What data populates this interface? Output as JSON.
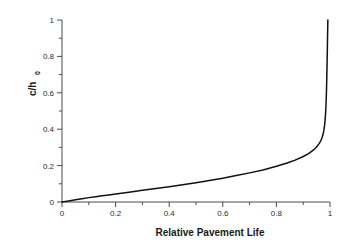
{
  "chart_data": {
    "type": "line",
    "title": "",
    "xlabel": "Relative Pavement Life",
    "ylabel": "c/h",
    "ylabel_subscript": "0",
    "ylabel_full": "c/h0",
    "xlim": [
      0,
      1
    ],
    "ylim": [
      0,
      1
    ],
    "xticks": [
      "0",
      "0.2",
      "0.4",
      "0.6",
      "0.8",
      "1"
    ],
    "xtick_values": [
      0,
      0.2,
      0.4,
      0.6,
      0.8,
      1
    ],
    "yticks": [
      "0",
      "0.2",
      "0.4",
      "0.6",
      "0.8",
      "1"
    ],
    "ytick_values": [
      0,
      0.2,
      0.4,
      0.6,
      0.8,
      1
    ],
    "grid": false,
    "legend": false,
    "legend_position": "none",
    "minor_ticks": true,
    "series": [
      {
        "name": "crack depth ratio",
        "color": "#111111",
        "x": [
          0.0,
          0.025,
          0.05,
          0.075,
          0.1,
          0.125,
          0.15,
          0.175,
          0.2,
          0.25,
          0.3,
          0.35,
          0.4,
          0.45,
          0.5,
          0.55,
          0.6,
          0.65,
          0.7,
          0.75,
          0.8,
          0.84,
          0.87,
          0.9,
          0.92,
          0.94,
          0.95,
          0.96,
          0.965,
          0.97,
          0.974,
          0.977,
          0.98,
          0.982,
          0.984,
          0.985,
          0.986,
          0.987,
          0.988,
          0.989,
          0.99,
          0.991,
          0.992
        ],
        "y": [
          0.0,
          0.006,
          0.012,
          0.018,
          0.024,
          0.029,
          0.034,
          0.039,
          0.044,
          0.054,
          0.064,
          0.074,
          0.084,
          0.095,
          0.106,
          0.118,
          0.131,
          0.145,
          0.16,
          0.176,
          0.196,
          0.214,
          0.23,
          0.25,
          0.266,
          0.288,
          0.302,
          0.322,
          0.335,
          0.352,
          0.372,
          0.392,
          0.425,
          0.455,
          0.5,
          0.53,
          0.57,
          0.62,
          0.68,
          0.75,
          0.83,
          0.92,
          1.0
        ]
      }
    ]
  },
  "axes": {
    "x_axis_name": "x-axis",
    "y_axis_name": "y-axis"
  }
}
